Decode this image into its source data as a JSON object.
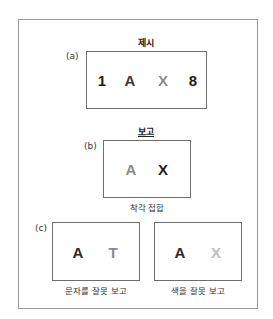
{
  "panel_a": {
    "title": "제시",
    "tag": "(a)",
    "items": [
      {
        "char": "1",
        "color": "#1e1e1e"
      },
      {
        "char": "A",
        "color": "#3a3a3a"
      },
      {
        "char": "X",
        "color": "#8c8c8c"
      },
      {
        "char": "8",
        "color": "#1e1e1e"
      }
    ]
  },
  "panel_b": {
    "title": "보고",
    "tag": "(b)",
    "items": [
      {
        "char": "A",
        "color": "#8a8a8a"
      },
      {
        "char": "X",
        "color": "#1e1e1e"
      }
    ],
    "caption": "착각 접합"
  },
  "panel_c": {
    "tag": "(c)",
    "left": {
      "items": [
        {
          "char": "A",
          "color": "#2a2a2a"
        },
        {
          "char": "T",
          "color": "#8a8a8a"
        }
      ],
      "caption": "문자를 잘못 보고"
    },
    "right": {
      "items": [
        {
          "char": "A",
          "color": "#2a2a2a"
        },
        {
          "char": "X",
          "color": "#bdbdbd"
        }
      ],
      "caption": "색을 잘못 보고"
    }
  }
}
